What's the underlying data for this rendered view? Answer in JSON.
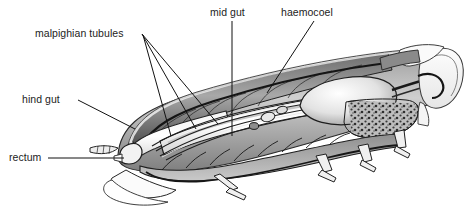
{
  "figure": {
    "kind": "labelled-anatomical-diagram",
    "background_color": "#ffffff",
    "line_color": "#1a1a1a",
    "text_color": "#1c1c1c",
    "width": 467,
    "height": 215
  },
  "labels": {
    "malpighian_tubules": "malpighian tubules",
    "mid_gut": "mid gut",
    "haemocoel": "haemocoel",
    "hind_gut": "hind gut",
    "rectum": "rectum"
  },
  "leaders": {
    "malpighian_a": "M142,34 L218,124",
    "malpighian_b": "M142,34 L196,129",
    "malpighian_c": "M143,35 L171,136",
    "mid_gut": "M232,21 L232,136",
    "haemocoel": "M314,21 L267,93",
    "hind_gut": "M78,100 L135,129",
    "rectum": "M48,158 L124,158"
  }
}
